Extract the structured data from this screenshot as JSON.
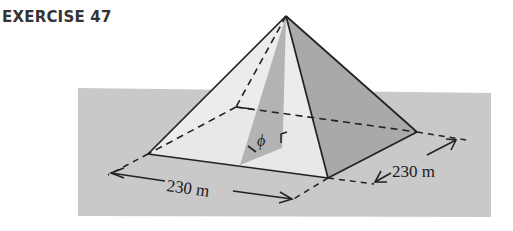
{
  "header": {
    "title": "EXERCISE 47"
  },
  "figure": {
    "base_length_label": "230 m",
    "base_width_label": "230 m",
    "angle_label": "ϕ",
    "colors": {
      "ground": "#c9c9c9",
      "left_face": "#e9e9e9",
      "front_face": "#ebebeb",
      "right_face": "#a8a8a8",
      "altitude_section": "#b3b3b3",
      "lines": "#222222"
    }
  }
}
